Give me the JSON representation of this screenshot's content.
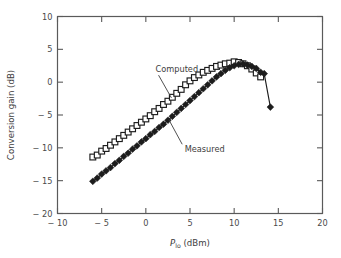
{
  "chart_data": {
    "type": "line",
    "title": "",
    "subtitle": "",
    "xlabel": "P_lo (dBm)",
    "xlabel_main": "P",
    "xlabel_sub": "lo",
    "xlabel_unit": "(dBm)",
    "ylabel": "Conversion gain (dB)",
    "xlim": [
      -10,
      20
    ],
    "ylim": [
      -20,
      10
    ],
    "xticks": [
      -10,
      -5,
      0,
      5,
      10,
      15,
      20
    ],
    "xticklabels": [
      "− 10",
      "− 5",
      "0",
      "5",
      "10",
      "15",
      "20"
    ],
    "yticks": [
      -20,
      -15,
      -10,
      -5,
      0,
      5,
      10
    ],
    "yticklabels": [
      "− 20",
      "− 15",
      "− 10",
      "− 5",
      "0",
      "5",
      "10"
    ],
    "grid": false,
    "legend_position": "inline-annotations",
    "tick_direction": "in",
    "series": [
      {
        "name": "Computed",
        "marker": "open-square",
        "color": "#1c1c1c",
        "x": [
          -6.0,
          -5.5,
          -5.0,
          -4.5,
          -4.0,
          -3.5,
          -3.0,
          -2.5,
          -2.0,
          -1.5,
          -1.0,
          -0.5,
          0.0,
          0.5,
          1.0,
          1.5,
          2.0,
          2.5,
          3.0,
          3.5,
          4.0,
          4.5,
          5.0,
          5.5,
          6.0,
          6.5,
          7.0,
          7.5,
          8.0,
          8.5,
          9.0,
          9.5,
          10.0,
          10.5,
          11.0,
          11.5,
          12.0,
          12.5,
          13.0
        ],
        "y": [
          -11.4,
          -11.1,
          -10.5,
          -10.1,
          -9.6,
          -9.1,
          -8.6,
          -8.1,
          -7.6,
          -7.1,
          -6.6,
          -6.1,
          -5.6,
          -5.1,
          -4.5,
          -4.0,
          -3.4,
          -2.9,
          -2.3,
          -1.7,
          -1.1,
          -0.4,
          0.2,
          0.7,
          1.1,
          1.5,
          1.8,
          2.1,
          2.4,
          2.6,
          2.8,
          2.9,
          3.1,
          3.0,
          2.8,
          2.5,
          2.0,
          1.4,
          0.8
        ]
      },
      {
        "name": "Measured",
        "marker": "filled-diamond",
        "color": "#1c1c1c",
        "x": [
          -6.0,
          -5.5,
          -5.0,
          -4.5,
          -4.0,
          -3.5,
          -3.0,
          -2.5,
          -2.0,
          -1.5,
          -1.0,
          -0.5,
          0.0,
          0.5,
          1.0,
          1.5,
          2.0,
          2.5,
          3.0,
          3.5,
          4.0,
          4.5,
          5.0,
          5.5,
          6.0,
          6.5,
          7.0,
          7.5,
          8.0,
          8.5,
          9.0,
          9.5,
          10.0,
          10.5,
          11.0,
          11.5,
          12.0,
          12.5,
          13.0,
          13.4,
          14.1
        ],
        "y": [
          -15.1,
          -14.6,
          -14.0,
          -13.5,
          -13.0,
          -12.4,
          -11.9,
          -11.3,
          -10.8,
          -10.2,
          -9.7,
          -9.1,
          -8.6,
          -8.0,
          -7.5,
          -6.9,
          -6.4,
          -5.8,
          -5.2,
          -4.6,
          -4.0,
          -3.4,
          -2.8,
          -2.2,
          -1.6,
          -1.0,
          -0.4,
          0.2,
          0.8,
          1.3,
          1.8,
          2.2,
          2.5,
          2.7,
          2.8,
          2.6,
          2.4,
          2.1,
          1.5,
          1.3,
          -3.8
        ]
      }
    ],
    "annotations": [
      {
        "text": "Computed",
        "x": 1.1,
        "y": 1.6,
        "points_to_x": 2.9,
        "points_to_y": -2.4
      },
      {
        "text": "Measured",
        "x": 4.4,
        "y": -10.6,
        "points_to_x": 2.6,
        "points_to_y": -5.7
      }
    ]
  },
  "style": {
    "axis_color": "#5a5a5a",
    "marker_color": "#1c1c1c",
    "background": "#ffffff",
    "text_color": "#3d3d3d"
  }
}
